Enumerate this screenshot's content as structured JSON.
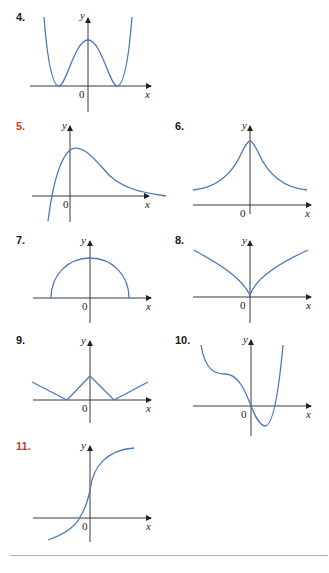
{
  "exercises": [
    {
      "number": "4.",
      "label_color": "#1a1a1a",
      "description": "W-shaped even function: two minima touching x-axis, local max on y-axis"
    },
    {
      "number": "5.",
      "label_color": "#c8402a",
      "description": "Curve rising from below, crossing x-axis left of 0, peak near y-axis, decaying toward x-axis"
    },
    {
      "number": "6.",
      "label_color": "#1a1a1a",
      "description": "Bell-shaped even function, peak on y-axis, positive asymptote"
    },
    {
      "number": "7.",
      "label_color": "#1a1a1a",
      "description": "Upper semicircle centered at origin"
    },
    {
      "number": "8.",
      "label_color": "#1a1a1a",
      "description": "Cusp at origin, symmetric V-like concave-down branches"
    },
    {
      "number": "9.",
      "label_color": "#1a1a1a",
      "description": "Piecewise linear: peak on y-axis, zeros on both sides, rising outward"
    },
    {
      "number": "10.",
      "label_color": "#1a1a1a",
      "description": "Quartic-like curve with inflection plateau left, through origin, min right of y-axis"
    },
    {
      "number": "11.",
      "label_color": "#1a1a1a",
      "description": "Increasing S-shaped curve crossing x-axis left of 0"
    }
  ],
  "axes": {
    "x_label": "x",
    "y_label": "y",
    "origin_label": "0"
  },
  "colors": {
    "curve": "#4a7ab8",
    "axis": "#222222",
    "accent_label": "#c8402a",
    "rule": "#8fb5dd"
  }
}
